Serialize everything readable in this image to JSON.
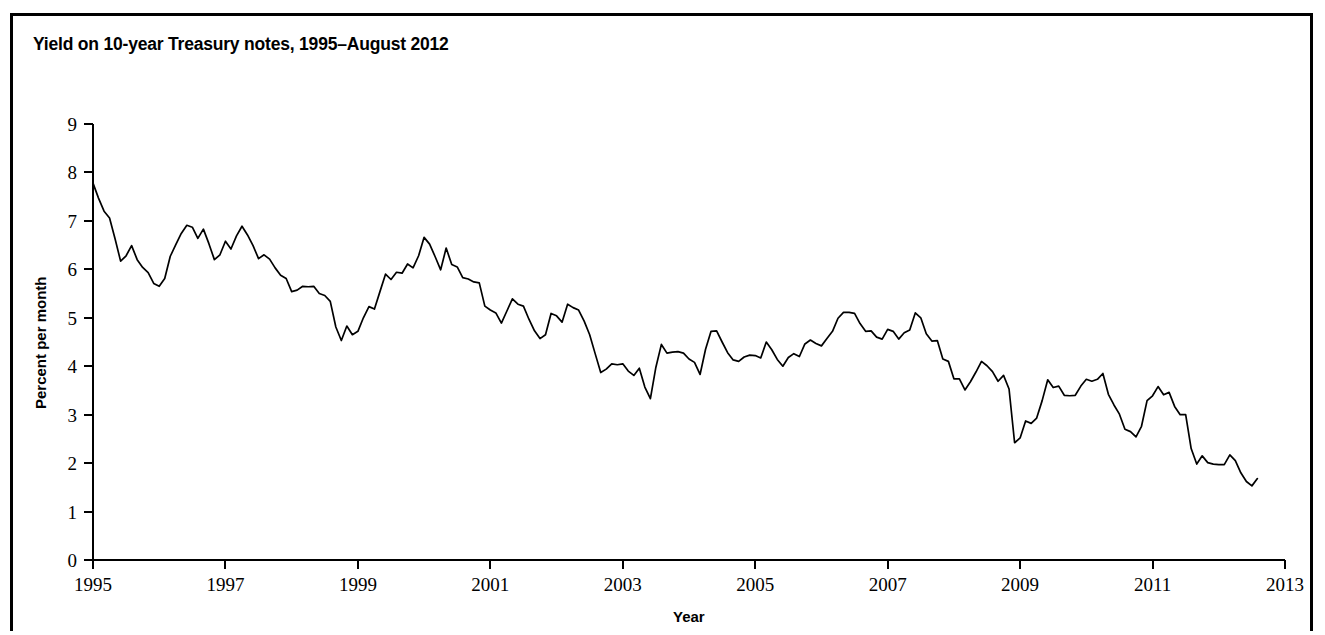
{
  "figure": {
    "title": "Yield on 10-year Treasury notes, 1995–August 2012",
    "background_color": "#ffffff",
    "line_color": "#000000",
    "border_color": "#000000"
  },
  "axis_label_x": "Year",
  "axis_label_y": "Percent per month",
  "chart_data": {
    "type": "line",
    "title": "Yield on 10-year Treasury notes, 1995–August 2012",
    "subtitle": "",
    "xlabel": "Year",
    "ylabel": "Percent per month",
    "xlim": [
      1995,
      2013
    ],
    "ylim": [
      0,
      9
    ],
    "xticks": [
      1995,
      1997,
      1999,
      2001,
      2003,
      2005,
      2007,
      2009,
      2011,
      2013
    ],
    "xtick_labels": [
      "1995",
      "1997",
      "1999",
      "2001",
      "2003",
      "2005",
      "2007",
      "2009",
      "2011",
      "2013"
    ],
    "yticks": [
      0,
      1,
      2,
      3,
      4,
      5,
      6,
      7,
      8,
      9
    ],
    "ytick_labels": [
      "0",
      "1",
      "2",
      "3",
      "4",
      "5",
      "6",
      "7",
      "8",
      "9"
    ],
    "grid": false,
    "legend": false,
    "legend_position": "none",
    "x_units": "decimal year (monthly observations)",
    "series": [
      {
        "name": "10-year Treasury note yield",
        "color": "#000000",
        "x": [
          1995.0,
          1995.083,
          1995.167,
          1995.25,
          1995.333,
          1995.417,
          1995.5,
          1995.583,
          1995.667,
          1995.75,
          1995.833,
          1995.917,
          1996.0,
          1996.083,
          1996.167,
          1996.25,
          1996.333,
          1996.417,
          1996.5,
          1996.583,
          1996.667,
          1996.75,
          1996.833,
          1996.917,
          1997.0,
          1997.083,
          1997.167,
          1997.25,
          1997.333,
          1997.417,
          1997.5,
          1997.583,
          1997.667,
          1997.75,
          1997.833,
          1997.917,
          1998.0,
          1998.083,
          1998.167,
          1998.25,
          1998.333,
          1998.417,
          1998.5,
          1998.583,
          1998.667,
          1998.75,
          1998.833,
          1998.917,
          1999.0,
          1999.083,
          1999.167,
          1999.25,
          1999.333,
          1999.417,
          1999.5,
          1999.583,
          1999.667,
          1999.75,
          1999.833,
          1999.917,
          2000.0,
          2000.083,
          2000.167,
          2000.25,
          2000.333,
          2000.417,
          2000.5,
          2000.583,
          2000.667,
          2000.75,
          2000.833,
          2000.917,
          2001.0,
          2001.083,
          2001.167,
          2001.25,
          2001.333,
          2001.417,
          2001.5,
          2001.583,
          2001.667,
          2001.75,
          2001.833,
          2001.917,
          2002.0,
          2002.083,
          2002.167,
          2002.25,
          2002.333,
          2002.417,
          2002.5,
          2002.583,
          2002.667,
          2002.75,
          2002.833,
          2002.917,
          2003.0,
          2003.083,
          2003.167,
          2003.25,
          2003.333,
          2003.417,
          2003.5,
          2003.583,
          2003.667,
          2003.75,
          2003.833,
          2003.917,
          2004.0,
          2004.083,
          2004.167,
          2004.25,
          2004.333,
          2004.417,
          2004.5,
          2004.583,
          2004.667,
          2004.75,
          2004.833,
          2004.917,
          2005.0,
          2005.083,
          2005.167,
          2005.25,
          2005.333,
          2005.417,
          2005.5,
          2005.583,
          2005.667,
          2005.75,
          2005.833,
          2005.917,
          2006.0,
          2006.083,
          2006.167,
          2006.25,
          2006.333,
          2006.417,
          2006.5,
          2006.583,
          2006.667,
          2006.75,
          2006.833,
          2006.917,
          2007.0,
          2007.083,
          2007.167,
          2007.25,
          2007.333,
          2007.417,
          2007.5,
          2007.583,
          2007.667,
          2007.75,
          2007.833,
          2007.917,
          2008.0,
          2008.083,
          2008.167,
          2008.25,
          2008.333,
          2008.417,
          2008.5,
          2008.583,
          2008.667,
          2008.75,
          2008.833,
          2008.917,
          2009.0,
          2009.083,
          2009.167,
          2009.25,
          2009.333,
          2009.417,
          2009.5,
          2009.583,
          2009.667,
          2009.75,
          2009.833,
          2009.917,
          2010.0,
          2010.083,
          2010.167,
          2010.25,
          2010.333,
          2010.417,
          2010.5,
          2010.583,
          2010.667,
          2010.75,
          2010.833,
          2010.917,
          2011.0,
          2011.083,
          2011.167,
          2011.25,
          2011.333,
          2011.417,
          2011.5,
          2011.583,
          2011.667,
          2011.75,
          2011.833,
          2011.917,
          2012.0,
          2012.083,
          2012.167,
          2012.25,
          2012.333,
          2012.417,
          2012.5,
          2012.583
        ],
        "values": [
          7.78,
          7.47,
          7.2,
          7.06,
          6.63,
          6.17,
          6.28,
          6.49,
          6.2,
          6.04,
          5.93,
          5.71,
          5.65,
          5.81,
          6.27,
          6.51,
          6.74,
          6.91,
          6.87,
          6.64,
          6.83,
          6.53,
          6.2,
          6.3,
          6.58,
          6.42,
          6.69,
          6.89,
          6.71,
          6.49,
          6.22,
          6.3,
          6.21,
          6.03,
          5.88,
          5.81,
          5.54,
          5.57,
          5.65,
          5.64,
          5.65,
          5.5,
          5.46,
          5.34,
          4.81,
          4.53,
          4.83,
          4.65,
          4.72,
          5.0,
          5.23,
          5.18,
          5.54,
          5.9,
          5.79,
          5.94,
          5.92,
          6.11,
          6.03,
          6.28,
          6.66,
          6.52,
          6.26,
          5.99,
          6.44,
          6.1,
          6.05,
          5.83,
          5.8,
          5.74,
          5.72,
          5.24,
          5.16,
          5.1,
          4.89,
          5.14,
          5.39,
          5.28,
          5.24,
          4.97,
          4.73,
          4.57,
          4.65,
          5.09,
          5.04,
          4.91,
          5.28,
          5.21,
          5.16,
          4.93,
          4.65,
          4.26,
          3.87,
          3.94,
          4.05,
          4.03,
          4.05,
          3.9,
          3.81,
          3.96,
          3.57,
          3.33,
          3.98,
          4.45,
          4.27,
          4.29,
          4.3,
          4.27,
          4.15,
          4.08,
          3.83,
          4.35,
          4.72,
          4.73,
          4.5,
          4.28,
          4.13,
          4.1,
          4.19,
          4.23,
          4.22,
          4.17,
          4.5,
          4.34,
          4.14,
          4.0,
          4.18,
          4.26,
          4.2,
          4.46,
          4.54,
          4.47,
          4.42,
          4.57,
          4.72,
          4.99,
          5.11,
          5.11,
          5.09,
          4.88,
          4.72,
          4.73,
          4.6,
          4.56,
          4.76,
          4.72,
          4.56,
          4.69,
          4.75,
          5.1,
          5.0,
          4.67,
          4.52,
          4.53,
          4.15,
          4.1,
          3.74,
          3.74,
          3.51,
          3.68,
          3.88,
          4.1,
          4.01,
          3.89,
          3.69,
          3.81,
          3.53,
          2.42,
          2.52,
          2.87,
          2.82,
          2.93,
          3.29,
          3.72,
          3.56,
          3.59,
          3.4,
          3.39,
          3.4,
          3.59,
          3.73,
          3.69,
          3.73,
          3.85,
          3.42,
          3.2,
          3.01,
          2.7,
          2.65,
          2.54,
          2.76,
          3.29,
          3.39,
          3.58,
          3.41,
          3.46,
          3.17,
          3.0,
          3.0,
          2.3,
          1.98,
          2.15,
          2.01,
          1.98,
          1.97,
          1.97,
          2.17,
          2.05,
          1.8,
          1.62,
          1.53,
          1.68
        ]
      }
    ]
  },
  "geometry": {
    "plot_left_px": 93,
    "plot_right_px": 1285,
    "plot_top_px": 124,
    "plot_bottom_px": 560
  }
}
